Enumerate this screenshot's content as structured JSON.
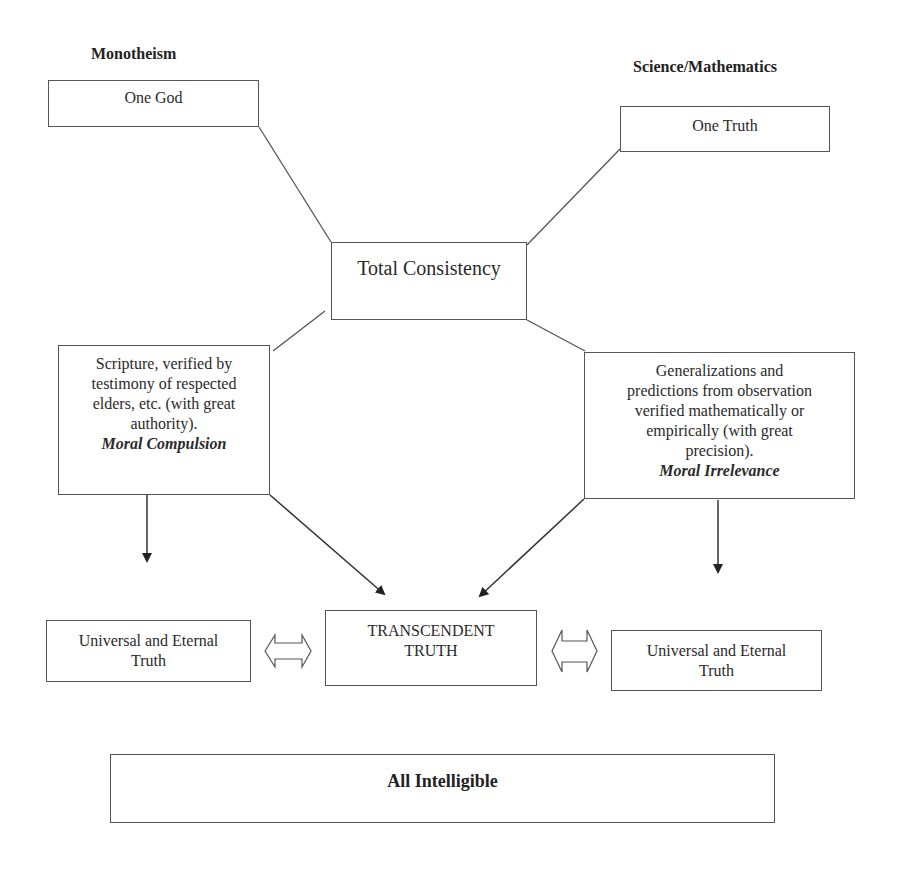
{
  "headings": {
    "left": "Monotheism",
    "right": "Science/Mathematics"
  },
  "nodes": {
    "one_god": "One God",
    "one_truth": "One Truth",
    "total_consistency": "Total Consistency",
    "left_method": {
      "lines": [
        "Scripture, verified by",
        "testimony of respected",
        "elders, etc. (with great",
        "authority)."
      ],
      "emphasis": "Moral Compulsion"
    },
    "right_method": {
      "lines": [
        "Generalizations and",
        "predictions from observation",
        "verified mathematically or",
        "empirically (with great",
        "precision)."
      ],
      "emphasis": "Moral Irrelevance"
    },
    "left_truth": [
      "Universal and Eternal",
      "Truth"
    ],
    "transcendent": [
      "TRANSCENDENT",
      "TRUTH"
    ],
    "right_truth": [
      "Universal and Eternal",
      "Truth"
    ],
    "all_intelligible": "All Intelligible"
  },
  "connections": [
    {
      "from": "one_god",
      "to": "total_consistency",
      "type": "line"
    },
    {
      "from": "one_truth",
      "to": "total_consistency",
      "type": "line"
    },
    {
      "from": "total_consistency",
      "to": "left_method",
      "type": "line"
    },
    {
      "from": "total_consistency",
      "to": "right_method",
      "type": "line"
    },
    {
      "from": "left_method",
      "to": "left_truth",
      "type": "arrow"
    },
    {
      "from": "left_method",
      "to": "transcendent",
      "type": "arrow"
    },
    {
      "from": "right_method",
      "to": "transcendent",
      "type": "arrow"
    },
    {
      "from": "right_method",
      "to": "right_truth",
      "type": "arrow"
    },
    {
      "from": "left_truth",
      "to": "transcendent",
      "type": "double-arrow"
    },
    {
      "from": "transcendent",
      "to": "right_truth",
      "type": "double-arrow"
    }
  ]
}
